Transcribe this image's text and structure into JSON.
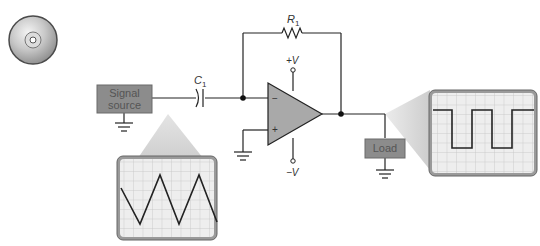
{
  "diagram": {
    "components": {
      "signal_source": {
        "line1": "Signal",
        "line2": "source"
      },
      "capacitor": {
        "label": "C",
        "subscript": "1"
      },
      "resistor": {
        "label": "R",
        "subscript": "1"
      },
      "opamp": {
        "inverting": "−",
        "noninverting": "+",
        "vplus": "+V",
        "vminus": "−V"
      },
      "load": {
        "label": "Load"
      }
    },
    "scopes": [
      {
        "position": "input",
        "waveform": "triangle"
      },
      {
        "position": "output",
        "waveform": "square"
      }
    ],
    "icons": {
      "media": "cd-icon"
    },
    "colors": {
      "box_fill": "#8c8c8c",
      "box_border": "#6a6a6a",
      "opamp_fill": "#a9a9a9",
      "scope_bg": "#eeeeee",
      "scope_grid": "#c4c4c4",
      "scope_border": "#777777",
      "wire": "#222222",
      "beam": "#d6d6d6"
    }
  }
}
